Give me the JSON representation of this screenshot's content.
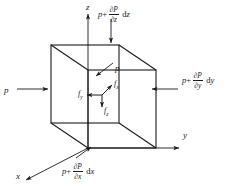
{
  "figure": {
    "type": "fluid-element-pressure-diagram",
    "stroke_color": "#1a1a1a",
    "background": "#ffffff"
  },
  "axes": [
    {
      "name": "z-axis",
      "label": "z",
      "direction": "up",
      "x": 86,
      "y": 3
    },
    {
      "name": "y-axis",
      "label": "y",
      "direction": "right",
      "x": 183,
      "y": 131
    },
    {
      "name": "x-axis",
      "label": "x",
      "direction": "down-left",
      "x": 16,
      "y": 172
    }
  ],
  "pressure_labels": [
    {
      "name": "pressure-left",
      "face": "left",
      "parts": {
        "base": "p",
        "op": "",
        "num": "",
        "den": "",
        "d": "",
        "var": ""
      },
      "text": "p",
      "x": 4,
      "y": 86
    },
    {
      "name": "pressure-inner-top",
      "face": "inner-top",
      "parts": {
        "base": "p",
        "op": "",
        "num": "",
        "den": "",
        "d": "",
        "var": ""
      },
      "text": "p",
      "x": 115,
      "y": 64
    },
    {
      "name": "pressure-top",
      "face": "top",
      "parts": {
        "base": "p",
        "op": "+",
        "num": "∂P",
        "den": "∂z",
        "d": "d",
        "var": "z"
      },
      "text": "p+ ∂P/∂z dz",
      "x": 98,
      "y": 6
    },
    {
      "name": "pressure-right",
      "face": "right",
      "parts": {
        "base": "p",
        "op": "+",
        "num": "∂P",
        "den": "∂y",
        "d": "d",
        "var": "y"
      },
      "text": "p+ ∂P/∂y dy",
      "x": 182,
      "y": 72
    },
    {
      "name": "pressure-bottom",
      "face": "bottom",
      "parts": {
        "base": "p",
        "op": "+",
        "num": "∂P",
        "den": "∂x",
        "d": "d",
        "var": "x"
      },
      "text": "p+ ∂P/∂x dx",
      "x": 62,
      "y": 163
    }
  ],
  "force_labels": [
    {
      "name": "force-y",
      "symbol": "f",
      "sub": "y",
      "direction": "left",
      "x": 78,
      "y": 90
    },
    {
      "name": "force-x",
      "symbol": "f",
      "sub": "x",
      "direction": "up-right",
      "x": 114,
      "y": 86
    },
    {
      "name": "force-z",
      "symbol": "f",
      "sub": "z",
      "direction": "down",
      "x": 104,
      "y": 108
    }
  ]
}
